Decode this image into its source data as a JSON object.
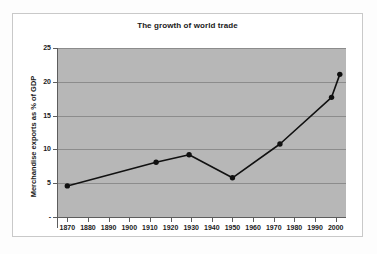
{
  "figure": {
    "title": "The growth of world trade"
  },
  "axes": {
    "y_title": "Merchandise exports as % of GDP",
    "y_ticks": [
      "-",
      "5",
      "10",
      "15",
      "20",
      "25"
    ],
    "y_tick_values": [
      0,
      5,
      10,
      15,
      20,
      25
    ],
    "x_ticks": [
      "1870",
      "1880",
      "1890",
      "1900",
      "1910",
      "1920",
      "1930",
      "1940",
      "1950",
      "1960",
      "1970",
      "1980",
      "1990",
      "2000"
    ],
    "x_tick_values": [
      1870,
      1880,
      1890,
      1900,
      1910,
      1920,
      1930,
      1940,
      1950,
      1960,
      1970,
      1980,
      1990,
      2000
    ]
  },
  "style": {
    "plot_background": "#b7b7b7",
    "gridline_color": "#8c8c8c",
    "series_color": "#111111",
    "axis_color": "#5d5d5d",
    "page_background": "#ffffff",
    "frame_border": "#c9c9c9"
  },
  "chart_data": {
    "type": "line",
    "title": "The growth of world trade",
    "xlabel": "",
    "ylabel": "Merchandise exports as % of GDP",
    "xlim": [
      1865,
      2005
    ],
    "ylim": [
      0,
      25
    ],
    "grid": true,
    "legend": "none",
    "x": [
      1870,
      1913,
      1929,
      1950,
      1973,
      1998,
      2002
    ],
    "values": [
      4.6,
      8.1,
      9.2,
      5.8,
      10.8,
      17.7,
      21.1
    ],
    "series": [
      {
        "name": "Merchandise exports as % of GDP",
        "x": [
          1870,
          1913,
          1929,
          1950,
          1973,
          1998,
          2002
        ],
        "values": [
          4.6,
          8.1,
          9.2,
          5.8,
          10.8,
          17.7,
          21.1
        ],
        "marker": "filled-circle",
        "color": "#111111"
      }
    ]
  }
}
